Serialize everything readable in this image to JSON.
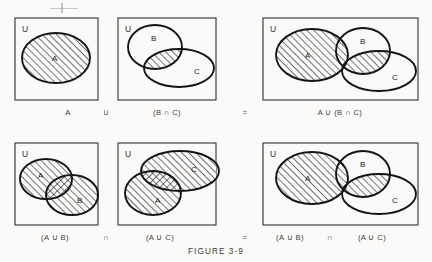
{
  "figure": {
    "caption": "FIGURE 3-9",
    "universe_label": "U",
    "set_labels": {
      "a": "A",
      "b": "B",
      "c": "C"
    },
    "operators": {
      "union": "∪",
      "intersection": "∩",
      "equals": "="
    }
  },
  "rows": [
    {
      "id": "row-top",
      "panels": [
        {
          "id": "panel-a",
          "expression": "A",
          "universe": "U",
          "sets": [
            "A"
          ]
        },
        {
          "id": "panel-b-cap-c",
          "expression": "(B ∩ C)",
          "universe": "U",
          "sets": [
            "B",
            "C"
          ]
        },
        {
          "id": "panel-a-cup-bc",
          "expression": "A ∪ (B ∩ C)",
          "universe": "U",
          "sets": [
            "A",
            "B",
            "C"
          ]
        }
      ],
      "connectors": [
        {
          "id": "connector-union-top",
          "symbol": "∪"
        },
        {
          "id": "connector-equals-top",
          "symbol": "="
        }
      ]
    },
    {
      "id": "row-bottom",
      "panels": [
        {
          "id": "panel-a-cup-b",
          "expression": "(A ∪ B)",
          "universe": "U",
          "sets": [
            "A",
            "B"
          ]
        },
        {
          "id": "panel-a-cup-c",
          "expression": "(A ∪ C)",
          "universe": "U",
          "sets": [
            "A",
            "C"
          ]
        },
        {
          "id": "panel-ab-cap-ac",
          "expression_left": "(A ∪ B)",
          "expression_op": "∩",
          "expression_right": "(A ∪ C)",
          "universe": "U",
          "sets": [
            "A",
            "B",
            "C"
          ]
        }
      ],
      "connectors": [
        {
          "id": "connector-intersection-bottom",
          "symbol": "∩"
        },
        {
          "id": "connector-equals-bottom",
          "symbol": "="
        }
      ]
    }
  ],
  "colors": {
    "background": "#fbfaf8",
    "frame_stroke": "#3a3a3a",
    "region_stroke": "#141414",
    "hatch_stroke": "#232323",
    "text": "#2a2a2a"
  }
}
